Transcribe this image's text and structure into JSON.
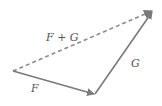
{
  "diagram": {
    "colors": {
      "solid_vector": "#7a7a7a",
      "resultant_vector": "#8a8a8a",
      "label": "#555555",
      "background": "#ffffff"
    },
    "points": {
      "origin": [
        13,
        71
      ],
      "f_head": [
        95,
        94
      ],
      "g_head": [
        154,
        10
      ]
    },
    "vectors": [
      {
        "id": "F",
        "label": "F",
        "from": "origin",
        "to": "f_head",
        "style": "solid",
        "label_pos": [
          35,
          92
        ]
      },
      {
        "id": "G",
        "label": "G",
        "from": "f_head",
        "to": "g_head",
        "style": "solid",
        "label_pos": [
          131,
          67
        ]
      },
      {
        "id": "F+G",
        "label": "F + G",
        "from": "origin",
        "to": "g_head",
        "style": "dashed",
        "label_pos": [
          46,
          41
        ]
      }
    ]
  }
}
